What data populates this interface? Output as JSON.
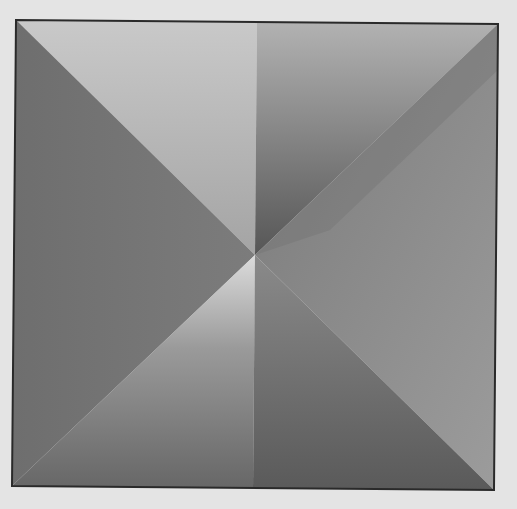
{
  "figure": {
    "frame": {
      "top_left": [
        16,
        20
      ],
      "top_right": [
        498,
        24
      ],
      "bottom_right": [
        494,
        490
      ],
      "bottom_left": [
        12,
        486
      ],
      "stroke": "#2a2a2a"
    },
    "center": [
      255,
      255
    ],
    "colors": {
      "background": "#e4e4e4",
      "top_left_half": [
        "#c8c8c8",
        "#a8a8a8"
      ],
      "top_right_half": [
        "#b4b4b4",
        "#5a5a5a"
      ],
      "left_triangle": "#707070",
      "right_triangle": [
        "#808080",
        "#9a9a9a"
      ],
      "bottom_left_half": [
        "#d8d8d8",
        "#6a6a6a"
      ],
      "bottom_right_half": [
        "#888888",
        "#5c5c5c"
      ]
    }
  }
}
